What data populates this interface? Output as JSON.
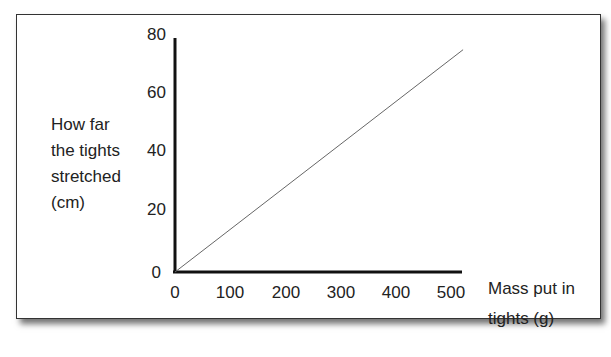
{
  "chart_data": {
    "type": "line",
    "title": "",
    "xlabel": "Mass put in tights (g)",
    "ylabel": "How far the tights stretched (cm)",
    "xlabel_lines": [
      "Mass put in",
      "tights (g)"
    ],
    "ylabel_lines": [
      "How far",
      "the tights",
      "stretched",
      "(cm)"
    ],
    "x_ticks": [
      "0",
      "100",
      "200",
      "300",
      "400",
      "500"
    ],
    "y_ticks": [
      "0",
      "20",
      "40",
      "60",
      "80"
    ],
    "xlim": [
      0,
      520
    ],
    "ylim": [
      0,
      80
    ],
    "grid": false,
    "legend": null,
    "series": [
      {
        "name": "stretch",
        "x": [
          0,
          520
        ],
        "y": [
          0,
          76
        ],
        "color": "#555555"
      }
    ]
  }
}
